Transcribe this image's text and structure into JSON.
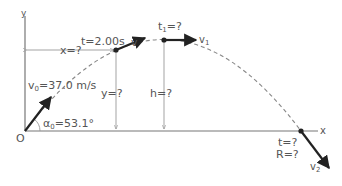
{
  "axes": {
    "y_label": "y",
    "x_label": "x",
    "origin_label": "O"
  },
  "initial": {
    "velocity_label": "v₀ = 37.0 m/s",
    "v_sym": "v",
    "v_sub": "0",
    "v_rest": "=37.0 m/s",
    "angle_sym": "α",
    "angle_sub": "0",
    "angle_rest": "=53.1°"
  },
  "point_t2": {
    "time_label": "t=2.00s",
    "vector_label": "v",
    "x_label": "x=?",
    "y_label": "y=?"
  },
  "apex": {
    "time_sym": "t",
    "time_sub": "1",
    "time_rest": "=?",
    "vector_sym": "v",
    "vector_sub": "1",
    "height_label": "h=?"
  },
  "landing": {
    "time_label": "t=?",
    "range_label": "R=?",
    "vector_sym": "v",
    "vector_sub": "2"
  },
  "colors": {
    "text": "#555555",
    "vector": "#222222",
    "axis": "#777777",
    "trajectory": "#888888"
  }
}
